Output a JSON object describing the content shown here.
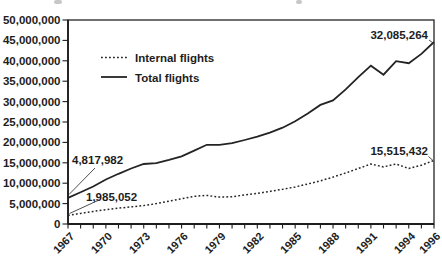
{
  "chart_data": {
    "type": "line",
    "title": "",
    "xlabel": "",
    "ylabel": "",
    "x": [
      1967,
      1968,
      1969,
      1970,
      1971,
      1972,
      1973,
      1974,
      1975,
      1976,
      1977,
      1978,
      1979,
      1980,
      1981,
      1982,
      1983,
      1984,
      1985,
      1986,
      1987,
      1988,
      1989,
      1990,
      1991,
      1992,
      1993,
      1994,
      1995,
      1996
    ],
    "x_tick_labels": [
      "1967",
      "1970",
      "1973",
      "1976",
      "1979",
      "1982",
      "1985",
      "1988",
      "1991",
      "1994",
      "1996"
    ],
    "ylim": [
      0,
      50000000
    ],
    "y_tick_step": 5000000,
    "y_tick_labels": [
      "0",
      "5,000,000",
      "10,000,000",
      "15,000,000",
      "20,000,000",
      "25,000,000",
      "30,000,000",
      "35,000,000",
      "40,000,000",
      "45,000,000",
      "50,000,000"
    ],
    "grid": false,
    "legend_position": "inside-top-left",
    "series": [
      {
        "name": "Internal flights",
        "line_style": "dotted",
        "values": [
          2100000,
          2600000,
          3100000,
          3500000,
          3900000,
          4200000,
          4500000,
          5000000,
          5600000,
          6200000,
          6800000,
          7000000,
          6600000,
          6700000,
          7100000,
          7500000,
          8000000,
          8500000,
          9100000,
          9800000,
          10600000,
          11500000,
          12500000,
          13600000,
          14700000,
          14000000,
          14700000,
          13600000,
          14400000,
          15600000
        ]
      },
      {
        "name": "Total flights",
        "line_style": "solid",
        "values": [
          6400000,
          7800000,
          9200000,
          10900000,
          12300000,
          13600000,
          14700000,
          14900000,
          15700000,
          16600000,
          18000000,
          19400000,
          19400000,
          19800000,
          20600000,
          21400000,
          22400000,
          23600000,
          25200000,
          27100000,
          29200000,
          30300000,
          33000000,
          36000000,
          38800000,
          36600000,
          39900000,
          39400000,
          41700000,
          44600000
        ]
      }
    ],
    "annotations": [
      {
        "text": "4,817,982",
        "series": "Total flights",
        "at_year": 1967
      },
      {
        "text": "1,985,052",
        "series": "Internal flights",
        "at_year": 1967
      },
      {
        "text": "32,085,264",
        "series": "Total flights",
        "at_year": 1996
      },
      {
        "text": "15,515,432",
        "series": "Internal flights",
        "at_year": 1996
      }
    ],
    "colors": {
      "line": "#242424",
      "text": "#1d1d1d",
      "background": "#ffffff"
    }
  }
}
